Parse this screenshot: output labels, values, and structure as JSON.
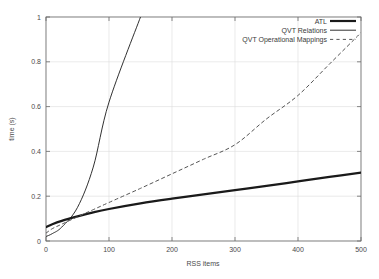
{
  "chart_data": {
    "type": "line",
    "title": "",
    "xlabel": "RSS items",
    "ylabel": "time (s)",
    "xlim": [
      0,
      500
    ],
    "ylim": [
      0,
      1
    ],
    "grid": true,
    "legend_position": "top-right",
    "xticks": [
      "0",
      "100",
      "200",
      "300",
      "400",
      "500"
    ],
    "xtick_values": [
      0,
      100,
      200,
      300,
      400,
      500
    ],
    "yticks": [
      "0",
      "0.2",
      "0.4",
      "0.6",
      "0.8",
      "1"
    ],
    "ytick_values": [
      0,
      0.2,
      0.4,
      0.6,
      0.8,
      1
    ],
    "x": [
      0,
      10,
      25,
      50,
      75,
      100,
      150,
      200,
      250,
      300,
      350,
      400,
      450,
      500
    ],
    "series": [
      {
        "name": "ATL",
        "style": "solid",
        "width": 2.2,
        "color": "#1a1a1a",
        "values": [
          0.062,
          0.075,
          0.09,
          0.11,
          0.128,
          0.143,
          0.168,
          0.189,
          0.208,
          0.227,
          0.246,
          0.266,
          0.286,
          0.305
        ]
      },
      {
        "name": "QVT Relations",
        "style": "solid",
        "width": 0.9,
        "color": "#1a1a1a",
        "values": [
          0.02,
          0.033,
          0.062,
          0.15,
          0.33,
          0.62,
          1.0,
          null,
          null,
          null,
          null,
          null,
          null,
          null
        ],
        "note": "exits top of plot near 70 RSS items"
      },
      {
        "name": "QVT Operational Mappings",
        "style": "dashed",
        "width": 1.0,
        "color": "#555555",
        "values": [
          0.035,
          0.055,
          0.075,
          0.108,
          0.14,
          0.172,
          0.235,
          0.3,
          0.365,
          0.43,
          0.545,
          0.65,
          0.79,
          0.93
        ]
      }
    ]
  },
  "legend": {
    "entries": [
      {
        "label": "ATL",
        "style": "solid-thick"
      },
      {
        "label": "QVT Relations",
        "style": "solid-thin"
      },
      {
        "label": "QVT Operational Mappings",
        "style": "dashed"
      }
    ]
  },
  "colors": {
    "axis": "#6b6b6b",
    "grid": "#dcdcdc",
    "series_primary": "#1a1a1a",
    "series_dashed": "#555555",
    "background": "#ffffff"
  }
}
